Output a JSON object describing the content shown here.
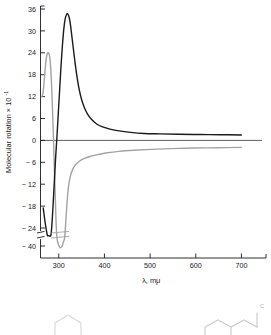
{
  "figure": {
    "name": "ord-cd-spectrum-figure",
    "background": "#ffffff",
    "width": 271,
    "height": 335
  },
  "chart_data": {
    "type": "line",
    "title": "",
    "subtitle": "",
    "xlabel": "λ, mμ",
    "ylabel": "Molecular rotation × 10",
    "ylabel_exponent": "-1",
    "xlim": [
      260,
      745
    ],
    "ylim": [
      -44,
      37
    ],
    "grid": false,
    "legend": "none",
    "x_ticks": [
      300,
      400,
      500,
      600,
      700
    ],
    "x_tick_labels": [
      "300",
      "400",
      "500",
      "600",
      "700"
    ],
    "y_ticks": [
      36,
      30,
      24,
      18,
      12,
      6,
      0,
      -6,
      -12,
      -18,
      -24,
      -40
    ],
    "y_tick_labels": [
      "36",
      "30",
      "24",
      "18",
      "12",
      "6",
      "0",
      "− 6",
      "− 12",
      "− 18",
      "− 24",
      "− 40"
    ],
    "y_axis_break": {
      "present": true,
      "between": [
        -24,
        -40
      ],
      "marker": "double-hash"
    },
    "zero_line": {
      "value": 0,
      "visible": true,
      "color": "#1a1a1a"
    },
    "series": [
      {
        "name": "ord-curve-black",
        "color": "#1a1a1a",
        "width": 1.4,
        "points": [
          [
            266,
            -18.5
          ],
          [
            269,
            -21.5
          ],
          [
            272,
            -24.0
          ],
          [
            275,
            -25.6
          ],
          [
            277,
            -26.3
          ],
          [
            279,
            -26.6
          ],
          [
            281,
            -26.4
          ],
          [
            283,
            -25.3
          ],
          [
            285,
            -23.0
          ],
          [
            287,
            -19.0
          ],
          [
            290,
            -12.0
          ],
          [
            293,
            -5.0
          ],
          [
            296,
            1.0
          ],
          [
            299,
            7.5
          ],
          [
            302,
            14.0
          ],
          [
            305,
            20.5
          ],
          [
            308,
            26.0
          ],
          [
            311,
            30.5
          ],
          [
            314,
            33.3
          ],
          [
            317,
            34.5
          ],
          [
            320,
            34.6
          ],
          [
            323,
            33.6
          ],
          [
            326,
            31.3
          ],
          [
            329,
            28.2
          ],
          [
            333,
            24.0
          ],
          [
            337,
            20.0
          ],
          [
            341,
            16.6
          ],
          [
            345,
            13.8
          ],
          [
            350,
            11.2
          ],
          [
            356,
            9.0
          ],
          [
            363,
            7.2
          ],
          [
            372,
            5.7
          ],
          [
            383,
            4.5
          ],
          [
            396,
            3.7
          ],
          [
            412,
            3.1
          ],
          [
            432,
            2.6
          ],
          [
            457,
            2.2
          ],
          [
            487,
            1.9
          ],
          [
            522,
            1.8
          ],
          [
            562,
            1.7
          ],
          [
            608,
            1.6
          ],
          [
            655,
            1.55
          ],
          [
            700,
            1.5
          ]
        ]
      },
      {
        "name": "cd-curve-gray",
        "color": "#a3a3a3",
        "width": 1.4,
        "points": [
          [
            262,
            12.0
          ],
          [
            264,
            12.2
          ],
          [
            266,
            13.5
          ],
          [
            268,
            16.0
          ],
          [
            270,
            19.2
          ],
          [
            272,
            21.8
          ],
          [
            274,
            23.4
          ],
          [
            276,
            24.0
          ],
          [
            278,
            23.9
          ],
          [
            280,
            23.0
          ],
          [
            282,
            20.5
          ],
          [
            284,
            16.0
          ],
          [
            286,
            9.5
          ],
          [
            288,
            2.0
          ],
          [
            290,
            -6.0
          ],
          [
            292,
            -14.0
          ],
          [
            294,
            -22.0
          ],
          [
            296,
            -29.0
          ],
          [
            298,
            -35.0
          ],
          [
            300,
            -39.5
          ],
          [
            302,
            -41.8
          ],
          [
            304,
            -42.3
          ],
          [
            306,
            -41.5
          ],
          [
            308,
            -39.0
          ],
          [
            310,
            -35.0
          ],
          [
            313,
            -28.0
          ],
          [
            316,
            -21.0
          ],
          [
            319,
            -15.5
          ],
          [
            322,
            -12.0
          ],
          [
            326,
            -9.5
          ],
          [
            331,
            -7.8
          ],
          [
            337,
            -6.6
          ],
          [
            345,
            -5.7
          ],
          [
            355,
            -5.0
          ],
          [
            368,
            -4.4
          ],
          [
            385,
            -3.9
          ],
          [
            406,
            -3.4
          ],
          [
            432,
            -3.0
          ],
          [
            464,
            -2.7
          ],
          [
            502,
            -2.45
          ],
          [
            546,
            -2.25
          ],
          [
            596,
            -2.1
          ],
          [
            650,
            -2.0
          ],
          [
            700,
            -1.9
          ]
        ]
      }
    ],
    "annotations": [
      {
        "name": "gray-curve-break",
        "type": "axis-break-hash",
        "x": 303,
        "y": -33
      }
    ]
  },
  "structures": {
    "name": "chemical-structure-strip",
    "caption": "",
    "label_right": "C"
  }
}
